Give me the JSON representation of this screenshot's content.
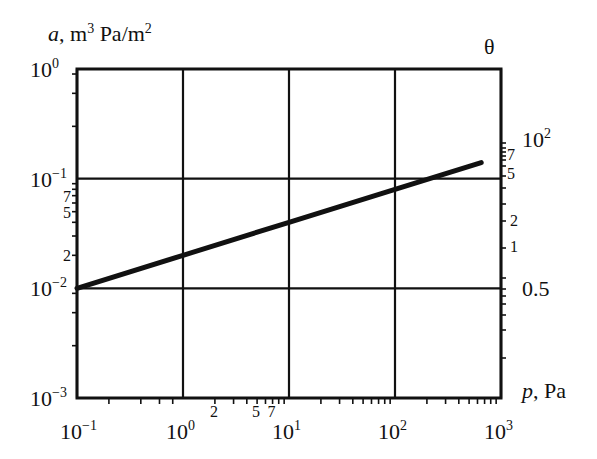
{
  "chart_data": {
    "type": "line",
    "title": "",
    "xlabel": "p, Pa",
    "ylabel": "a, m3 Pa/m2",
    "y2label": "θ",
    "xscale": "log",
    "yscale": "log",
    "xlim": [
      0.1,
      1000
    ],
    "ylim": [
      0.001,
      1
    ],
    "grid": true,
    "x_ticks": [
      {
        "value": 0.1,
        "base": "10",
        "exp": "−1"
      },
      {
        "value": 1,
        "base": "10",
        "exp": "0"
      },
      {
        "value": 10,
        "base": "10",
        "exp": "1"
      },
      {
        "value": 100,
        "base": "10",
        "exp": "2"
      },
      {
        "value": 1000,
        "base": "10",
        "exp": "3"
      }
    ],
    "x_minor_labels": [
      {
        "value": 2,
        "label": "2"
      },
      {
        "value": 5,
        "label": "5"
      },
      {
        "value": 7,
        "label": "7"
      }
    ],
    "y_ticks": [
      {
        "value": 1,
        "base": "10",
        "exp": "0"
      },
      {
        "value": 0.1,
        "base": "10",
        "exp": "−1"
      },
      {
        "value": 0.01,
        "base": "10",
        "exp": "−2"
      },
      {
        "value": 0.001,
        "base": "10",
        "exp": "−3"
      }
    ],
    "y_minor_labels": [
      {
        "value": 0.07,
        "label": "7"
      },
      {
        "value": 0.05,
        "label": "5"
      },
      {
        "value": 0.02,
        "label": "2"
      }
    ],
    "y2_ticks": [
      {
        "y_pos": 0.07,
        "label": "10",
        "exp": "2"
      },
      {
        "y_pos": 0.055,
        "label": "7",
        "exp": ""
      },
      {
        "y_pos": 0.1,
        "label": "5",
        "exp": ""
      },
      {
        "y_pos": 0.039,
        "label": "2",
        "exp": ""
      },
      {
        "y_pos": 0.022,
        "label": "1",
        "exp": ""
      },
      {
        "y_pos": 0.01,
        "label": "0.5",
        "exp": ""
      }
    ],
    "series": [
      {
        "name": "a(p)",
        "x": [
          0.1,
          1,
          10,
          100,
          650
        ],
        "values": [
          0.01,
          0.02,
          0.04,
          0.08,
          0.14
        ]
      }
    ]
  },
  "axes": {
    "ylabel_italic": "a",
    "ylabel_rest": ", m",
    "ylabel_sup1": "3",
    "ylabel_mid": " Pa/m",
    "ylabel_sup2": "2",
    "xlabel_italic": "p",
    "xlabel_rest": ", Pa",
    "y2label": "θ"
  }
}
